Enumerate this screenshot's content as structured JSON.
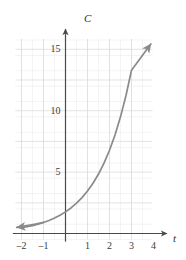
{
  "chart_data": {
    "type": "line",
    "title": "",
    "xlabel": "t",
    "ylabel": "C",
    "xlim": [
      -2.2,
      4.45
    ],
    "ylim": [
      -0.6,
      16.2
    ],
    "grid": true,
    "minor_grid": true,
    "legend": null,
    "axis_arrows": {
      "x_right": true,
      "y_top": true
    },
    "curve_arrows": {
      "left": true,
      "right": true
    },
    "curve_color": "#8a8a8a",
    "grid_color": "#dcdcdc",
    "minor_grid_color": "#ededed",
    "axis_color": "#4a4a4a",
    "x_ticks": [
      -2,
      -1,
      1,
      2,
      3,
      4
    ],
    "x_tick_labels": [
      "–2",
      "–1",
      "1",
      "2",
      "3",
      "4"
    ],
    "y_ticks": [
      5,
      10,
      15
    ],
    "y_tick_labels": [
      "5",
      "10",
      "15"
    ],
    "series": [
      {
        "name": "C(t)",
        "x": [
          -2.0,
          -1.75,
          -1.5,
          -1.25,
          -1.0,
          -0.75,
          -0.5,
          -0.25,
          0.0,
          0.25,
          0.5,
          0.75,
          1.0,
          1.25,
          1.5,
          1.75,
          2.0,
          2.25,
          2.5,
          2.75,
          3.0,
          3.25,
          3.5,
          3.75,
          4.0
        ],
        "y": [
          0.46,
          0.55,
          0.64,
          0.76,
          0.9,
          1.06,
          1.26,
          1.49,
          1.76,
          2.08,
          2.47,
          2.92,
          3.46,
          4.09,
          4.84,
          5.73,
          6.78,
          8.02,
          9.5,
          11.24,
          13.3,
          15.74,
          18.63,
          22.05,
          26.1
        ]
      }
    ],
    "annotations": []
  },
  "labels": {
    "y_axis": "C",
    "x_axis": "t"
  }
}
